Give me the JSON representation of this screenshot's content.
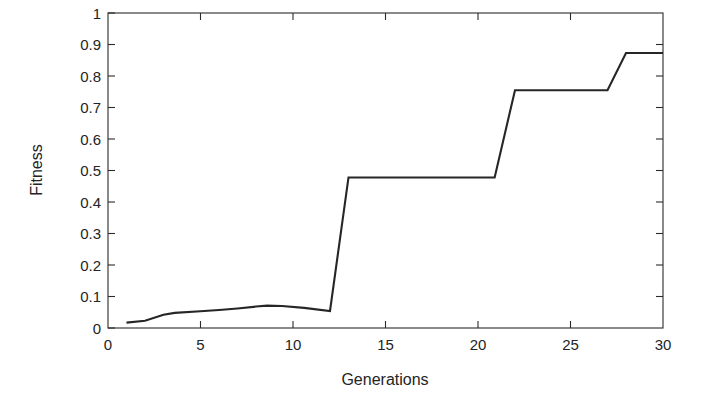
{
  "chart_data": {
    "type": "line",
    "title": "",
    "xlabel": "Generations",
    "ylabel": "Fitness",
    "xlim": [
      0,
      30
    ],
    "ylim": [
      0,
      1
    ],
    "grid": false,
    "legend": null,
    "xticks": [
      0,
      5,
      10,
      15,
      20,
      25,
      30
    ],
    "xticklabels": [
      "0",
      "5",
      "10",
      "15",
      "20",
      "25",
      "30"
    ],
    "yticks": [
      0,
      0.1,
      0.2,
      0.3,
      0.4,
      0.5,
      0.6,
      0.7,
      0.8,
      0.9,
      1
    ],
    "yticklabels": [
      "0",
      "0.1",
      "0.2",
      "0.3",
      "0.4",
      "0.5",
      "0.6",
      "0.7",
      "0.8",
      "0.9",
      "1"
    ],
    "series": [
      {
        "name": "Best fitness",
        "color": "#262626",
        "x": [
          1,
          2,
          3,
          3.6,
          5,
          6,
          7,
          8,
          8.6,
          9.4,
          10.6,
          12,
          13,
          20.9,
          22,
          27,
          28,
          30
        ],
        "values": [
          0.017,
          0.023,
          0.042,
          0.048,
          0.053,
          0.057,
          0.062,
          0.068,
          0.071,
          0.07,
          0.064,
          0.054,
          0.478,
          0.478,
          0.755,
          0.755,
          0.873,
          0.873
        ]
      }
    ],
    "annotations": []
  },
  "figure": {
    "background_color": "#ffffff",
    "axes_color": "#2b2b2b",
    "line_color": "#262626"
  }
}
